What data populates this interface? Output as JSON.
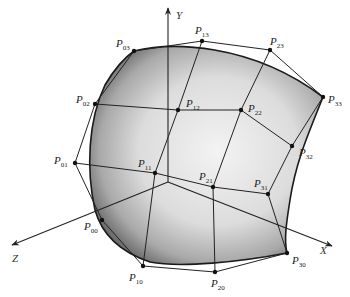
{
  "figure": {
    "axes": [
      {
        "name": "Y",
        "label": "Y",
        "from": [
          168,
          182
        ],
        "to": [
          168,
          8
        ],
        "label_pos": [
          176,
          19
        ]
      },
      {
        "name": "Z",
        "label": "Z",
        "from": [
          168,
          182
        ],
        "to": [
          12,
          245
        ],
        "label_pos": [
          12,
          262
        ]
      },
      {
        "name": "X",
        "label": "X",
        "from": [
          168,
          182
        ],
        "to": [
          332,
          246
        ],
        "label_pos": [
          320,
          254
        ]
      }
    ],
    "control_points": [
      {
        "id": "P00",
        "label": "P",
        "sub": "00",
        "pos": [
          102,
          220
        ],
        "label_pos": [
          84,
          230
        ]
      },
      {
        "id": "P01",
        "label": "P",
        "sub": "01",
        "pos": [
          75,
          163
        ],
        "label_pos": [
          54,
          164
        ]
      },
      {
        "id": "P02",
        "label": "P",
        "sub": "02",
        "pos": [
          95,
          104
        ],
        "label_pos": [
          76,
          103
        ]
      },
      {
        "id": "P03",
        "label": "P",
        "sub": "03",
        "pos": [
          134,
          51
        ],
        "label_pos": [
          116,
          47
        ]
      },
      {
        "id": "P10",
        "label": "P",
        "sub": "10",
        "pos": [
          143,
          266
        ],
        "label_pos": [
          129,
          281
        ]
      },
      {
        "id": "P11",
        "label": "P",
        "sub": "11",
        "pos": [
          155,
          173
        ],
        "label_pos": [
          138,
          167
        ]
      },
      {
        "id": "P12",
        "label": "P",
        "sub": "12",
        "pos": [
          178,
          110
        ],
        "label_pos": [
          186,
          107
        ]
      },
      {
        "id": "P13",
        "label": "P",
        "sub": "13",
        "pos": [
          202,
          41
        ],
        "label_pos": [
          195,
          34
        ]
      },
      {
        "id": "P20",
        "label": "P",
        "sub": "20",
        "pos": [
          215,
          272
        ],
        "label_pos": [
          211,
          287
        ]
      },
      {
        "id": "P21",
        "label": "P",
        "sub": "21",
        "pos": [
          213,
          187
        ],
        "label_pos": [
          199,
          180
        ]
      },
      {
        "id": "P22",
        "label": "P",
        "sub": "22",
        "pos": [
          241,
          110
        ],
        "label_pos": [
          248,
          112
        ]
      },
      {
        "id": "P23",
        "label": "P",
        "sub": "23",
        "pos": [
          270,
          50
        ],
        "label_pos": [
          270,
          45
        ]
      },
      {
        "id": "P30",
        "label": "P",
        "sub": "30",
        "pos": [
          287,
          253
        ],
        "label_pos": [
          292,
          264
        ]
      },
      {
        "id": "P31",
        "label": "P",
        "sub": "31",
        "pos": [
          268,
          194
        ],
        "label_pos": [
          254,
          187
        ]
      },
      {
        "id": "P32",
        "label": "P",
        "sub": "32",
        "pos": [
          292,
          146
        ],
        "label_pos": [
          299,
          156
        ]
      },
      {
        "id": "P33",
        "label": "P",
        "sub": "33",
        "pos": [
          323,
          97
        ],
        "label_pos": [
          328,
          103
        ]
      }
    ],
    "colors": {
      "line": "#222222",
      "surface_light": "#f2f2f2",
      "surface_dark": "#5a5a5a",
      "background": "#ffffff"
    }
  }
}
